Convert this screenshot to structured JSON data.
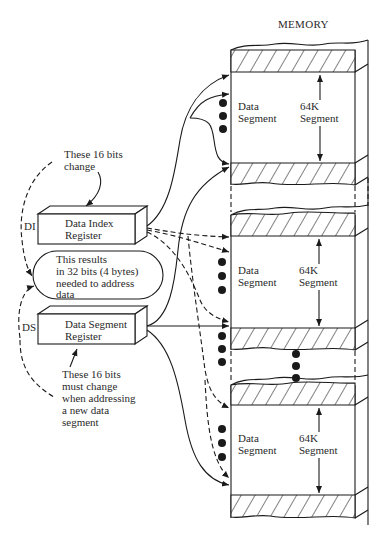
{
  "memory": {
    "title": "MEMORY",
    "segments": [
      {
        "left_label_line1": "Data",
        "left_label_line2": "Segment",
        "size_line1": "64K",
        "size_line2": "Segment"
      },
      {
        "left_label_line1": "Data",
        "left_label_line2": "Segment",
        "size_line1": "64K",
        "size_line2": "Segment"
      },
      {
        "left_label_line1": "Data",
        "left_label_line2": "Segment",
        "size_line1": "64K",
        "size_line2": "Segment"
      }
    ]
  },
  "registers": {
    "di": {
      "tag": "DI",
      "line1": "Data Index",
      "line2": "Register"
    },
    "ds": {
      "tag": "DS",
      "line1": "Data Segment",
      "line2": "Register"
    }
  },
  "notes": {
    "top": {
      "line1": "These 16 bits",
      "line2": "change"
    },
    "middle": {
      "line1": "This results",
      "line2": "in 32 bits (4 bytes)",
      "line3": "needed to address",
      "line4": "data"
    },
    "bottom": {
      "line1": "These 16 bits",
      "line2": "must change",
      "line3": "when addressing",
      "line4": "a new data",
      "line5": "segment"
    }
  },
  "colors": {
    "ink": "#1a1a1a",
    "text": "#2a2a2a",
    "background": "#ffffff"
  }
}
